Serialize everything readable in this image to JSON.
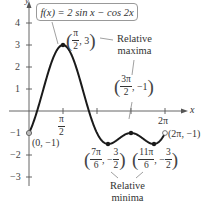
{
  "chart_data": {
    "type": "line",
    "title": "f(x) = 2 sin x − cos 2x",
    "xlabel": "x",
    "ylabel": "y",
    "xlim": [
      0,
      6.2832
    ],
    "ylim": [
      -3,
      4
    ],
    "grid": false,
    "x_ticks": [
      {
        "value": 1.5708,
        "label": "π/2"
      },
      {
        "value": 3.1416,
        "label": ""
      },
      {
        "value": 4.7124,
        "label": ""
      },
      {
        "value": 6.2832,
        "label": "2π"
      }
    ],
    "y_ticks": [
      {
        "value": 4,
        "label": "4"
      },
      {
        "value": 3,
        "label": "3"
      },
      {
        "value": 2,
        "label": "2"
      },
      {
        "value": 1,
        "label": "1"
      },
      {
        "value": -1,
        "label": "−1"
      },
      {
        "value": -2,
        "label": "−2"
      },
      {
        "value": -3,
        "label": "−3"
      }
    ],
    "series": [
      {
        "name": "f(x) = 2 sin x − cos 2x",
        "function": "2*sin(x) - cos(2*x)",
        "domain": [
          0,
          6.2832
        ]
      }
    ],
    "points": [
      {
        "x": 0,
        "y": -1,
        "label": "(0, −1)",
        "marker": "open"
      },
      {
        "x": 1.5708,
        "y": 3,
        "label": "(π/2, 3)",
        "marker": "filled",
        "kind": "Relative maxima"
      },
      {
        "x": 3.6652,
        "y": -1.5,
        "label": "(7π/6, −3/2)",
        "marker": "filled",
        "kind": "Relative minima"
      },
      {
        "x": 4.7124,
        "y": -1,
        "label": "(3π/2, −1)",
        "marker": "filled",
        "kind": "Relative maxima"
      },
      {
        "x": 5.7596,
        "y": -1.5,
        "label": "(11π/6, −3/2)",
        "marker": "filled",
        "kind": "Relative minima"
      },
      {
        "x": 6.2832,
        "y": -1,
        "label": "(2π, −1)",
        "marker": "open"
      }
    ],
    "annotations": [
      "Relative maxima",
      "Relative minima"
    ]
  },
  "labels": {
    "function": "f(x) = 2 sin x − cos 2x",
    "x_axis": "x",
    "y_axis": "y",
    "tick_pi_over_2_num": "π",
    "tick_pi_over_2_den": "2",
    "tick_2pi": "2π",
    "y4": "4",
    "y3": "3",
    "y2": "2",
    "y1": "1",
    "ym1": "−1",
    "ym2": "−2",
    "ym3": "−3",
    "pt_origin": "(0, −1)",
    "pt_end": "(2π, −1)",
    "max1_num": "π",
    "max1_den": "2",
    "max1_y": ", 3",
    "max2_num": "3π",
    "max2_den": "2",
    "max2_y": ", −1",
    "min1_num": "7π",
    "min1_den": "6",
    "min1_ynum": "3",
    "min1_yden": "2",
    "min2_num": "11π",
    "min2_den": "6",
    "min2_ynum": "3",
    "min2_yden": "2",
    "neg_comma": ", −",
    "rel_max_1": "Relative",
    "rel_max_2": "maxima",
    "rel_min_1": "Relative",
    "rel_min_2": "minima"
  }
}
